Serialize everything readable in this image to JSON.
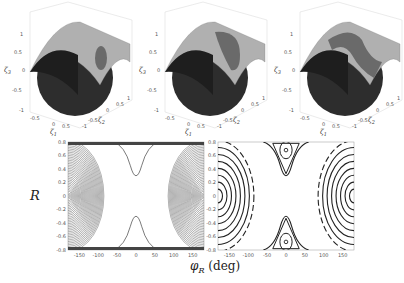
{
  "chart_data": [
    {
      "type": "surface3d",
      "panel": "top-left",
      "xlabel": "ζ1",
      "ylabel": "ζ2",
      "zlabel": "ζ3",
      "xticks": [
        "-0.5",
        "0",
        "0.5"
      ],
      "yticks": [
        "-1",
        "-0.5",
        "0",
        "0.5",
        "1"
      ],
      "zticks": [
        "-1",
        "-0.5",
        "0",
        "0.5",
        "1"
      ],
      "description": "Unit sphere intersected with parabolic cylinder surface; small elliptic intersection patch"
    },
    {
      "type": "surface3d",
      "panel": "top-middle",
      "xlabel": "ζ1",
      "ylabel": "ζ2",
      "zlabel": "ζ3",
      "xticks": [
        "-0.5",
        "0",
        "0.5"
      ],
      "yticks": [
        "-1",
        "-0.5",
        "0",
        "0.5",
        "1"
      ],
      "zticks": [
        "-1",
        "-0.5",
        "0",
        "0.5",
        "1"
      ],
      "description": "Unit sphere intersected with parabolic cylinder surface; larger intersection patch"
    },
    {
      "type": "surface3d",
      "panel": "top-right",
      "xlabel": "ζ1",
      "ylabel": "ζ2",
      "zlabel": "ζ3",
      "xticks": [
        "-0.5",
        "0",
        "0.5"
      ],
      "yticks": [
        "-1",
        "-0.5",
        "0",
        "0.5",
        "1"
      ],
      "zticks": [
        "-1",
        "-0.5",
        "0",
        "0.5",
        "1"
      ],
      "description": "Unit sphere intersected with parabolic cylinder surface; band-shaped intersection"
    },
    {
      "type": "contour",
      "panel": "bottom-left",
      "xlabel": "φR (deg)",
      "ylabel": "R",
      "xlim": [
        -180,
        180
      ],
      "ylim": [
        -0.8,
        0.8
      ],
      "xticks": [
        "-150",
        "-100",
        "-50",
        "0",
        "50",
        "100",
        "150"
      ],
      "yticks": [
        "0.8",
        "0.6",
        "0.4",
        "0.2",
        "0",
        "-0.2",
        "-0.4",
        "-0.6",
        "-0.8"
      ],
      "description": "Dense contour lines: nested arcs centered at φR=±180, R=0; hourglass separatrix around φR=0"
    },
    {
      "type": "contour",
      "panel": "bottom-right",
      "xlabel": "φR (deg)",
      "ylabel": "R",
      "xlim": [
        -180,
        180
      ],
      "ylim": [
        -0.8,
        0.8
      ],
      "xticks": [
        "-150",
        "-100",
        "-50",
        "0",
        "50",
        "100",
        "150"
      ],
      "yticks": [
        "0.8",
        "0.6",
        "0.4",
        "0.2",
        "0",
        "-0.2",
        "-0.4",
        "-0.6",
        "-0.8"
      ],
      "description": "Sparse contours with dashed separatrix; closed orbits around centers at (0, ±0.68)"
    }
  ],
  "labels": {
    "R": "R",
    "phi": "φ",
    "phi_sub": "R",
    "unit": "(deg)"
  }
}
